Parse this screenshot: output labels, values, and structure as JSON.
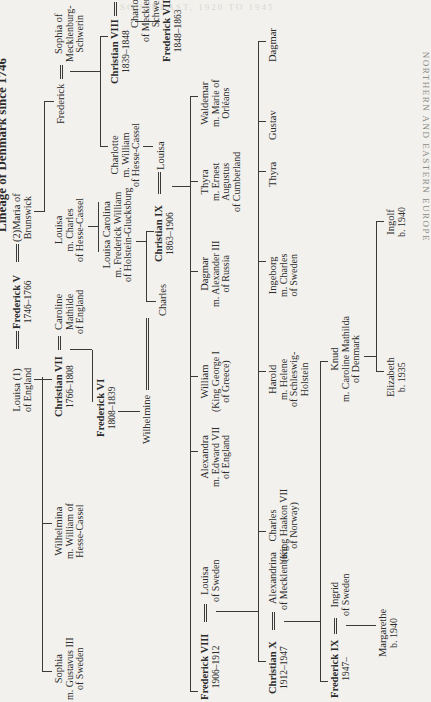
{
  "page": {
    "title": "Lineage of Denmark since 1746",
    "running_header": "NORTHERN AND EASTERN EUROPE",
    "bleed_lines": [
      "SOUTHEAST, 1920 TO 1945",
      "B. NORTHERN AND EASTERN EUROPE"
    ]
  },
  "tree": {
    "louisa": {
      "name": "Louisa (1)",
      "sub": "of England"
    },
    "frederick_v": {
      "name": "Frederick V",
      "dates": "1746–1766"
    },
    "maria": {
      "name": "(2)Maria of",
      "sub": "Brunswick"
    },
    "sophia_g": {
      "name": "Sophia",
      "sub1": "m. Gustavus III",
      "sub2": "of Sweden"
    },
    "wilhelmina": {
      "name": "Wilhelmina",
      "sub1": "m. William of",
      "sub2": "Hesse-Cassel"
    },
    "christian_vii": {
      "name": "Christian VII",
      "dates": "1766–1808"
    },
    "caroline": {
      "name": "Caroline",
      "sub1": "Mathilde",
      "sub2": "of England"
    },
    "louisa2": {
      "name": "Louisa",
      "sub1": "m. Charles",
      "sub2": "of Hesse-Cassel"
    },
    "frederick": {
      "name": "Frederick"
    },
    "sophia_m": {
      "name": "Sophia of",
      "sub1": "Mecklenburg-",
      "sub2": "Schwerin"
    },
    "frederick_vi": {
      "name": "Frederick VI",
      "dates": "1808–1839"
    },
    "louisa_carolina": {
      "name": "Louisa Carolina",
      "sub1": "m. Frederick William",
      "sub2": "of Holstein-Glucksburg"
    },
    "charlotte_h": {
      "name": "Charlotte",
      "sub1": "m. William",
      "sub2": "of Hesse-Cassel"
    },
    "christian_viii": {
      "name": "Christian VIII",
      "dates": "1839–1848"
    },
    "charlotte_m": {
      "name": "Charlotte",
      "sub1": "of Mecklenburg-",
      "sub2": "Schwerin"
    },
    "frederick_vii": {
      "name": "Frederick VII",
      "dates": "1848–1863"
    },
    "wilhelmine": {
      "name": "Wilhelmine"
    },
    "charles": {
      "name": "Charles"
    },
    "christian_ix": {
      "name": "Christian IX",
      "dates": "1863–1906"
    },
    "louisa3": {
      "name": "Louisa"
    },
    "frederick_viii": {
      "name": "Frederick VIII",
      "dates": "1906–1912"
    },
    "louisa_s": {
      "name": "Louisa",
      "sub": "of Sweden"
    },
    "alexandra": {
      "name": "Alexandra",
      "sub1": "m. Edward VII",
      "sub2": "of England"
    },
    "william": {
      "name": "William",
      "sub1": "(King George I",
      "sub2": "of Greece)"
    },
    "dagmar": {
      "name": "Dagmar",
      "sub1": "m. Alexander III",
      "sub2": "of Russia"
    },
    "thyra": {
      "name": "Thyra",
      "sub1": "m. Ernest",
      "sub2": "Augustus",
      "sub3": "of Cumberland"
    },
    "waldemar": {
      "name": "Waldemar",
      "sub1": "m. Marie of",
      "sub2": "Orléans"
    },
    "christian_x": {
      "name": "Christian X",
      "dates": "1912–1947"
    },
    "alexandrina": {
      "name": "Alexandrina",
      "sub": "of Mecklenburg"
    },
    "charles_h": {
      "name": "Charles",
      "sub1": "(King Haakon VII",
      "sub2": "of Norway)"
    },
    "harold": {
      "name": "Harold",
      "sub1": "m. Helene",
      "sub2": "of Schleswig-",
      "sub3": "Holstein"
    },
    "ingeborg": {
      "name": "Ingeborg",
      "sub1": "m. Charles",
      "sub2": "of Sweden"
    },
    "thyra2": {
      "name": "Thyra"
    },
    "gustav": {
      "name": "Gustav"
    },
    "dagmar2": {
      "name": "Dagmar"
    },
    "frederick_ix": {
      "name": "Frederick IX",
      "dates": "1947–"
    },
    "ingrid": {
      "name": "Ingrid",
      "sub": "of Sweden"
    },
    "knud": {
      "name": "Knud",
      "sub1": "m. Caroline Mathilda",
      "sub2": "of Denmark"
    },
    "margarethe": {
      "name": "Margarethe",
      "sub": "b. 1940"
    },
    "elizabeth": {
      "name": "Elizabeth",
      "sub": "b. 1935"
    },
    "ingolf": {
      "name": "Ingolf",
      "sub": "b. 1940"
    }
  }
}
